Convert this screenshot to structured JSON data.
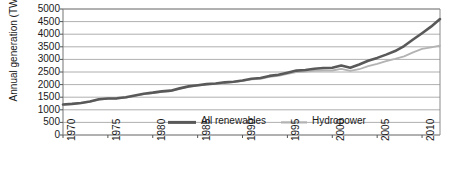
{
  "chart_data": {
    "type": "line",
    "title": "",
    "xlabel": "",
    "ylabel": "Annual generation (TWh)",
    "xlim": [
      1970,
      2012
    ],
    "ylim": [
      0,
      5000
    ],
    "grid": true,
    "legend_position": "inside-bottom-center",
    "ytick_labels": [
      "5000",
      "4500",
      "4000",
      "3500",
      "3000",
      "2500",
      "2000",
      "1500",
      "1000",
      "500",
      "0"
    ],
    "ytick_values": [
      5000,
      4500,
      4000,
      3500,
      3000,
      2500,
      2000,
      1500,
      1000,
      500,
      0
    ],
    "xtick_labels": [
      "1970",
      "1975",
      "1980",
      "1985",
      "1990",
      "1995",
      "2000",
      "2005",
      "2010"
    ],
    "xtick_values": [
      1970,
      1975,
      1980,
      1985,
      1990,
      1995,
      2000,
      2005,
      2010
    ],
    "x": [
      1970,
      1971,
      1972,
      1973,
      1974,
      1975,
      1976,
      1977,
      1978,
      1979,
      1980,
      1981,
      1982,
      1983,
      1984,
      1985,
      1986,
      1987,
      1988,
      1989,
      1990,
      1991,
      1992,
      1993,
      1994,
      1995,
      1996,
      1997,
      1998,
      1999,
      2000,
      2001,
      2002,
      2003,
      2004,
      2005,
      2006,
      2007,
      2008,
      2009,
      2010,
      2011,
      2012
    ],
    "series": [
      {
        "name": "All renewables",
        "color": "#595959",
        "width": 2.6,
        "values": [
          1210,
          1235,
          1270,
          1330,
          1420,
          1450,
          1455,
          1500,
          1570,
          1640,
          1680,
          1730,
          1760,
          1850,
          1930,
          1975,
          2020,
          2045,
          2090,
          2115,
          2165,
          2230,
          2260,
          2345,
          2390,
          2470,
          2555,
          2580,
          2630,
          2660,
          2670,
          2755,
          2665,
          2800,
          2945,
          3060,
          3190,
          3330,
          3530,
          3790,
          4040,
          4300,
          4600
        ]
      },
      {
        "name": "Hydropower",
        "color": "#b3b3b3",
        "width": 1.8,
        "values": [
          1200,
          1225,
          1262,
          1322,
          1408,
          1440,
          1443,
          1487,
          1555,
          1625,
          1665,
          1715,
          1745,
          1838,
          1918,
          1960,
          2005,
          2030,
          2072,
          2098,
          2148,
          2205,
          2228,
          2310,
          2350,
          2425,
          2500,
          2520,
          2545,
          2560,
          2560,
          2620,
          2540,
          2610,
          2730,
          2820,
          2930,
          3020,
          3120,
          3280,
          3420,
          3480,
          3545
        ]
      }
    ]
  },
  "legend": {
    "items": [
      {
        "label": "All renewables",
        "color": "#595959"
      },
      {
        "label": "Hydropower",
        "color": "#b3b3b3"
      }
    ]
  },
  "axes": {
    "y_title": "Annual generation (TWh)"
  }
}
